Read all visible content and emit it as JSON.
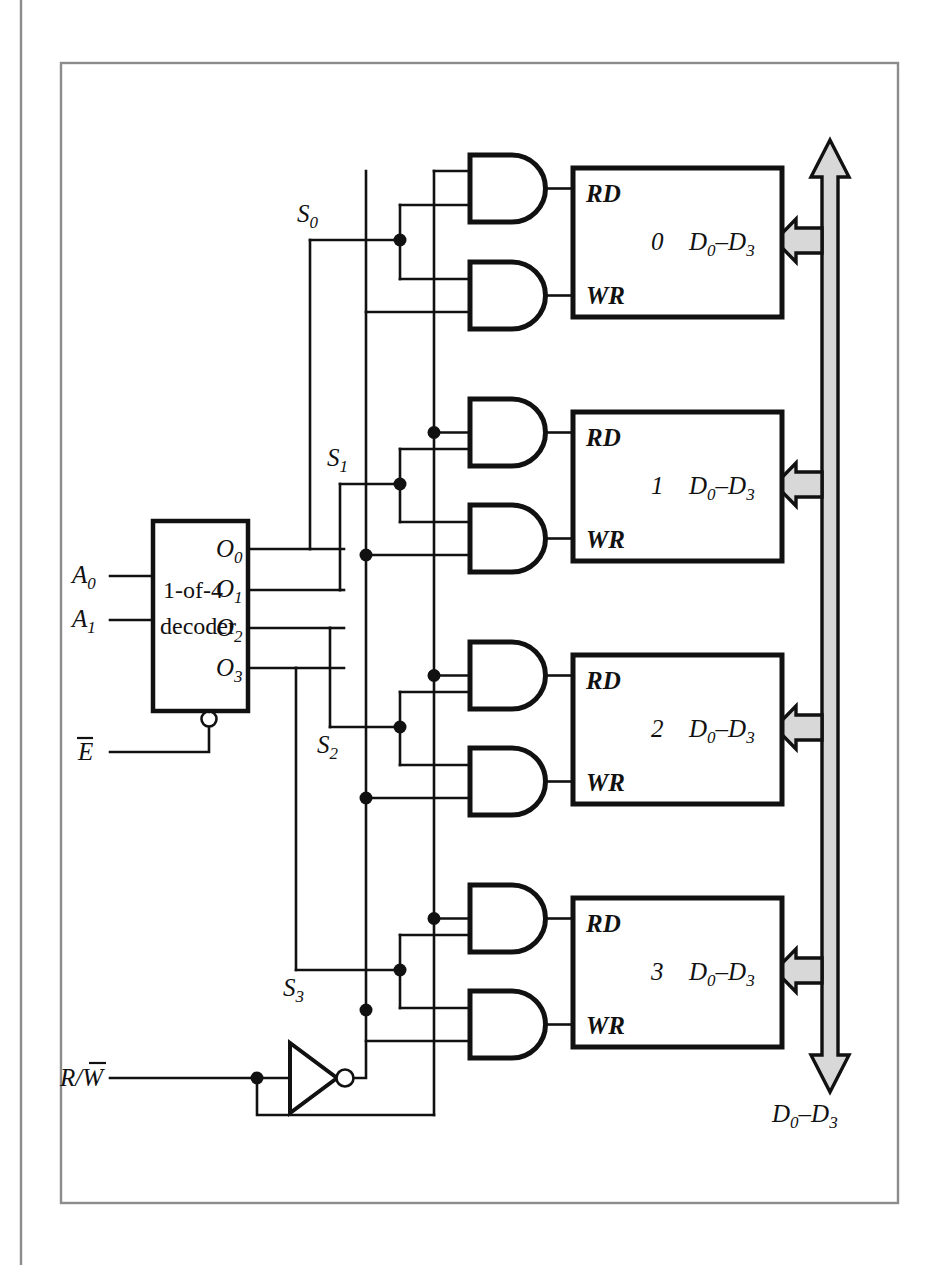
{
  "figure": {
    "kind": "logic-circuit-diagram",
    "colors": {
      "line": "#111111",
      "bus_fill": "#d8d8d8",
      "frame": "#8c8c8c",
      "background": "#ffffff"
    }
  },
  "decoder": {
    "title_line1": "1-of-4",
    "title_line2": "decoder",
    "inputs": [
      {
        "base": "A",
        "sub": "0"
      },
      {
        "base": "A",
        "sub": "1"
      }
    ],
    "enable": {
      "base": "E",
      "overbar": true
    },
    "outputs": [
      {
        "base": "O",
        "sub": "0"
      },
      {
        "base": "O",
        "sub": "1"
      },
      {
        "base": "O",
        "sub": "2"
      },
      {
        "base": "O",
        "sub": "3"
      }
    ]
  },
  "select_lines": [
    {
      "base": "S",
      "sub": "0"
    },
    {
      "base": "S",
      "sub": "1"
    },
    {
      "base": "S",
      "sub": "2"
    },
    {
      "base": "S",
      "sub": "3"
    }
  ],
  "control": {
    "rw_input": {
      "text": "R/W",
      "overbar_part": "W"
    },
    "inverter": "not-gate"
  },
  "memory_blocks": [
    {
      "id": "0",
      "rd": "RD",
      "wr": "WR",
      "data": "D0–D3",
      "data_base": "D",
      "data_sub_lo": "0",
      "data_sub_hi": "3"
    },
    {
      "id": "1",
      "rd": "RD",
      "wr": "WR",
      "data": "D0–D3",
      "data_base": "D",
      "data_sub_lo": "0",
      "data_sub_hi": "3"
    },
    {
      "id": "2",
      "rd": "RD",
      "wr": "WR",
      "data": "D0–D3",
      "data_base": "D",
      "data_sub_lo": "0",
      "data_sub_hi": "3"
    },
    {
      "id": "3",
      "rd": "RD",
      "wr": "WR",
      "data": "D0–D3",
      "data_base": "D",
      "data_sub_lo": "0",
      "data_sub_hi": "3"
    }
  ],
  "bus": {
    "label_base": "D",
    "label_sub_lo": "0",
    "label_sub_hi": "3",
    "label_dash": "–",
    "direction": "bidirectional"
  },
  "gates": {
    "and_label": "AND",
    "count": 8
  }
}
